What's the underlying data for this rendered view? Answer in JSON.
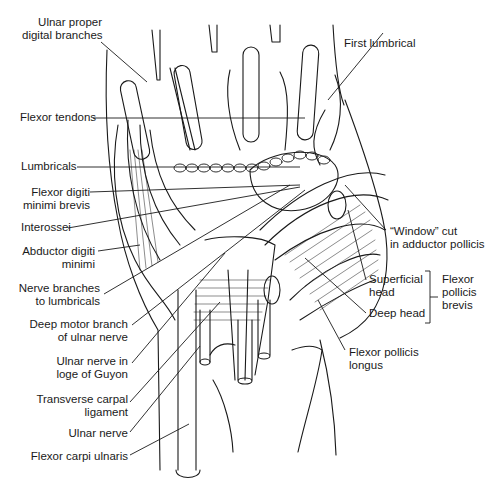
{
  "diagram": {
    "labels_left": [
      {
        "id": "ulnar-proper-digital-branches",
        "lines": [
          "Ulnar proper",
          "digital branches"
        ]
      },
      {
        "id": "flexor-tendons",
        "lines": [
          "Flexor tendons"
        ]
      },
      {
        "id": "lumbricals",
        "lines": [
          "Lumbricals"
        ]
      },
      {
        "id": "flexor-digiti-minimi-brevis",
        "lines": [
          "Flexor digiti",
          "minimi brevis"
        ]
      },
      {
        "id": "interossei",
        "lines": [
          "Interossei"
        ]
      },
      {
        "id": "abductor-digiti-minimi",
        "lines": [
          "Abductor digiti",
          "minimi"
        ]
      },
      {
        "id": "nerve-branches-to-lumbricals",
        "lines": [
          "Nerve branches",
          "to lumbricals"
        ]
      },
      {
        "id": "deep-motor-branch",
        "lines": [
          "Deep motor branch",
          "of ulnar nerve"
        ]
      },
      {
        "id": "ulnar-nerve-guyon",
        "lines": [
          "Ulnar nerve in",
          "loge of Guyon"
        ]
      },
      {
        "id": "transverse-carpal-ligament",
        "lines": [
          "Transverse carpal",
          "ligament"
        ]
      },
      {
        "id": "ulnar-nerve",
        "lines": [
          "Ulnar nerve"
        ]
      },
      {
        "id": "flexor-carpi-ulnaris",
        "lines": [
          "Flexor carpi ulnaris"
        ]
      }
    ],
    "labels_right": [
      {
        "id": "first-lumbrical",
        "lines": [
          "First lumbrical"
        ]
      },
      {
        "id": "window-cut",
        "lines": [
          "“Window” cut",
          "in adductor pollicis"
        ]
      },
      {
        "id": "superficial-head",
        "lines": [
          "Superficial",
          "head"
        ]
      },
      {
        "id": "deep-head",
        "lines": [
          "Deep head"
        ]
      },
      {
        "id": "flexor-pollicis-brevis",
        "lines": [
          "Flexor",
          "pollicis",
          "brevis"
        ]
      },
      {
        "id": "flexor-pollicis-longus",
        "lines": [
          "Flexor pollicis",
          "longus"
        ]
      }
    ],
    "colors": {
      "ink": "#1a1a1a",
      "background": "#ffffff"
    }
  }
}
